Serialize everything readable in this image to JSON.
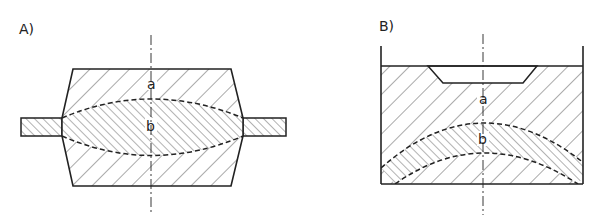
{
  "figure": {
    "panels": [
      {
        "id": "A",
        "label": "A)",
        "description": "Closed-die forging: upper and lower dies with lens-shaped workpiece and flash",
        "region_labels": {
          "a": "a",
          "b": "b"
        }
      },
      {
        "id": "B",
        "label": "B)",
        "description": "Container with curved (arc-shaped) deformation zone beneath a recessed punch",
        "region_labels": {
          "a": "a",
          "b": "b"
        }
      }
    ],
    "colors": {
      "line": "#222222",
      "hatch": "#555555",
      "background": "#ffffff"
    }
  }
}
